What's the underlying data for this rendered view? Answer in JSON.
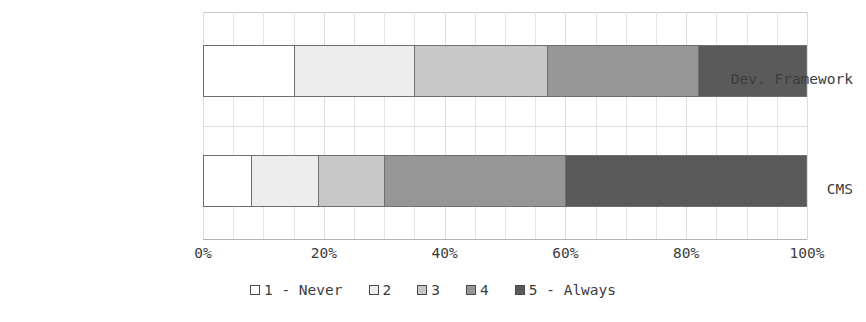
{
  "chart_data": {
    "type": "bar",
    "orientation": "horizontal",
    "stacked": true,
    "normalized": "percent",
    "title": "",
    "xlabel": "",
    "ylabel": "",
    "xlim": [
      0,
      100
    ],
    "grid": true,
    "grid_axis": "x",
    "legend_position": "bottom",
    "categories": [
      "Dev. Framework",
      "CMS"
    ],
    "series": [
      {
        "name": "1 - Never",
        "color": "#ffffff",
        "values": [
          15,
          8
        ]
      },
      {
        "name": "2",
        "color": "#ededed",
        "values": [
          20,
          11
        ]
      },
      {
        "name": "3",
        "color": "#c8c8c8",
        "values": [
          22,
          11
        ]
      },
      {
        "name": "4",
        "color": "#969696",
        "values": [
          25,
          30
        ]
      },
      {
        "name": "5 - Always",
        "color": "#5a5a5a",
        "values": [
          18,
          40
        ]
      }
    ],
    "xticks": [
      {
        "value": 0,
        "label": "0%"
      },
      {
        "value": 20,
        "label": "20%"
      },
      {
        "value": 40,
        "label": "40%"
      },
      {
        "value": 60,
        "label": "60%"
      },
      {
        "value": 80,
        "label": "80%"
      },
      {
        "value": 100,
        "label": "100%"
      }
    ],
    "minor_tick_step": 5
  },
  "legend": {
    "items": [
      {
        "label": "1 - Never",
        "color": "#ffffff"
      },
      {
        "label": "2",
        "color": "#ededed"
      },
      {
        "label": "3",
        "color": "#c8c8c8"
      },
      {
        "label": "4",
        "color": "#969696"
      },
      {
        "label": "5 - Always",
        "color": "#5a5a5a"
      }
    ]
  },
  "axis": {
    "category_labels": [
      "Dev. Framework",
      "CMS"
    ],
    "x_tick_labels": [
      "0%",
      "20%",
      "40%",
      "60%",
      "80%",
      "100%"
    ]
  },
  "colors": {
    "bar_border": "#6f6f6f",
    "gridline": "#e4e4e4",
    "axis_line": "#b4b4b4",
    "text": "#3c3c3c",
    "background": "#ffffff"
  }
}
